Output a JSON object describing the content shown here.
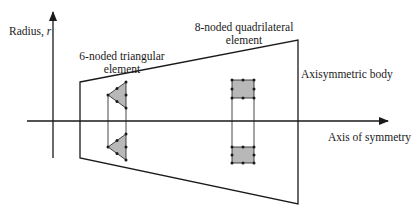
{
  "diagram": {
    "labels": {
      "radius_axis": "Radius, ",
      "radius_symbol": "r",
      "symmetry_axis": "Axis of symmetry",
      "body": "Axisymmetric body",
      "triangular_element_line1": "6-noded triangular",
      "triangular_element_line2": "element",
      "quad_element_line1": "8-noded quadrilateral",
      "quad_element_line2": "element"
    },
    "colors": {
      "stroke": "#1a1a1a",
      "element_fill": "#b8b8b8",
      "background": "#ffffff"
    },
    "elements": [
      {
        "type": "triangle",
        "nodes": 6,
        "count": 2
      },
      {
        "type": "quadrilateral",
        "nodes": 8,
        "count": 2
      }
    ]
  }
}
